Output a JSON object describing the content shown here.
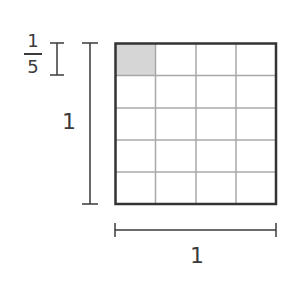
{
  "diagram": {
    "grid": {
      "columns": 4,
      "rows": 5,
      "shaded_cells": [
        {
          "row": 0,
          "col": 0
        }
      ]
    },
    "colors": {
      "outline": "#333333",
      "grid_lines": "#a8a8a8",
      "shaded": "#d6d6d6",
      "text": "#3a3a3a"
    },
    "labels": {
      "small_bracket": {
        "numerator": "1",
        "denominator": "5"
      },
      "vertical_bracket": "1",
      "horizontal_bracket": "1"
    }
  }
}
